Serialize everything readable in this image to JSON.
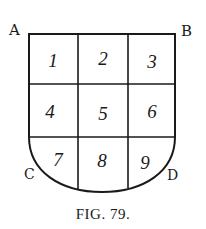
{
  "figure": {
    "caption": "FIG. 79.",
    "corner_labels": {
      "top_left": "A",
      "top_right": "B",
      "bottom_left": "C",
      "bottom_right": "D"
    },
    "grid": {
      "rows": 3,
      "cols": 3,
      "cells": [
        "1",
        "2",
        "3",
        "4",
        "5",
        "6",
        "7",
        "8",
        "9"
      ]
    },
    "colors": {
      "ink": "#1a1a1a",
      "paper": "#ffffff"
    }
  }
}
